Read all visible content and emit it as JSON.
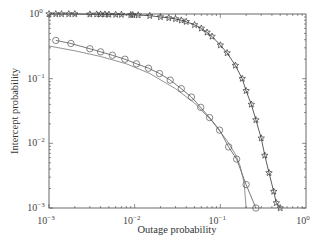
{
  "chart_data": {
    "type": "line",
    "title": "",
    "xlabel": "Outage probability",
    "ylabel": "Intercept probability",
    "xscale": "log",
    "yscale": "log",
    "xlim": [
      0.001,
      1
    ],
    "ylim": [
      0.001,
      1
    ],
    "x_ticks": [
      "10^-3",
      "10^-2",
      "10^-1",
      "10^0"
    ],
    "y_ticks": [
      "10^0",
      "10^-1",
      "10^-2",
      "10^-3"
    ],
    "grid": false,
    "legend": null,
    "series": [
      {
        "name": "star-marker curve",
        "marker": "star",
        "color": "#333333",
        "x": [
          0.001,
          0.0012,
          0.0014,
          0.0017,
          0.002,
          0.003,
          0.0036,
          0.004,
          0.0045,
          0.005,
          0.006,
          0.007,
          0.009,
          0.0095,
          0.011,
          0.015,
          0.02,
          0.025,
          0.03,
          0.035,
          0.04,
          0.05,
          0.06,
          0.07,
          0.08,
          0.1,
          0.12,
          0.15,
          0.18,
          0.2,
          0.23,
          0.26,
          0.3,
          0.33,
          0.37,
          0.42,
          0.45,
          0.5
        ],
        "y": [
          1.0,
          1.0,
          1.0,
          1.0,
          1.0,
          0.99,
          0.99,
          0.99,
          0.99,
          0.98,
          0.98,
          0.98,
          0.97,
          0.97,
          0.96,
          0.94,
          0.9,
          0.87,
          0.84,
          0.8,
          0.76,
          0.68,
          0.6,
          0.52,
          0.45,
          0.33,
          0.25,
          0.16,
          0.1,
          0.065,
          0.04,
          0.023,
          0.012,
          0.0065,
          0.0035,
          0.0018,
          0.0012,
          0.001
        ]
      },
      {
        "name": "circle-marker curve",
        "marker": "circle",
        "color": "#555555",
        "x": [
          0.0012,
          0.0018,
          0.003,
          0.004,
          0.0055,
          0.0077,
          0.0105,
          0.0145,
          0.0195,
          0.026,
          0.035,
          0.046,
          0.059,
          0.075,
          0.098,
          0.125,
          0.155,
          0.2,
          0.26
        ],
        "y": [
          0.39,
          0.35,
          0.29,
          0.26,
          0.23,
          0.2,
          0.17,
          0.145,
          0.12,
          0.095,
          0.07,
          0.052,
          0.036,
          0.025,
          0.016,
          0.0088,
          0.0057,
          0.0023,
          0.001
        ]
      },
      {
        "name": "plain curve",
        "marker": "none",
        "color": "#777777",
        "x": [
          0.001,
          0.002,
          0.004,
          0.008,
          0.015,
          0.03,
          0.05,
          0.08,
          0.12,
          0.15,
          0.17,
          0.19,
          0.2
        ],
        "y": [
          0.32,
          0.27,
          0.22,
          0.17,
          0.12,
          0.07,
          0.042,
          0.022,
          0.011,
          0.0068,
          0.0045,
          0.0024,
          0.001
        ]
      }
    ]
  },
  "labels": {
    "xlabel": "Outage probability",
    "ylabel": "Intercept probability"
  }
}
